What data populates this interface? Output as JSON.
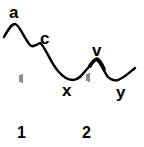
{
  "diagram": {
    "point_labels": {
      "a": "a",
      "c": "c",
      "x": "x",
      "v": "v",
      "y": "y"
    },
    "region_labels": [
      "1",
      "2"
    ],
    "tick_marks": [
      "||",
      "||"
    ],
    "line_color": "#000000",
    "background": "#ffffff"
  }
}
